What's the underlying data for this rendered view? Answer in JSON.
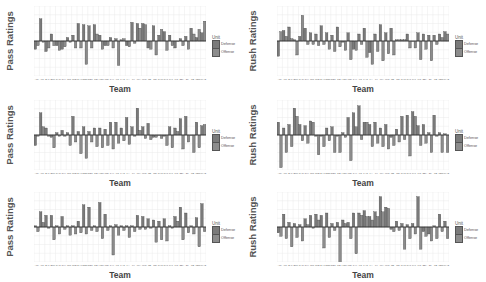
{
  "chart_data": [
    {
      "type": "bar",
      "title": "",
      "xlabel": "Team",
      "ylabel": "Pass Ratings",
      "legend": {
        "title": "Unit",
        "entries": [
          "Defense",
          "Offense"
        ],
        "position": "right"
      },
      "grid": true,
      "ylim": [
        -1,
        1
      ],
      "categories": [
        "ARI",
        "ATL",
        "BAL",
        "BUF",
        "CAR",
        "CHI",
        "CIN",
        "CLE",
        "DAL",
        "DEN",
        "DET",
        "GB",
        "HOU",
        "IND",
        "JAX",
        "KC",
        "LAC",
        "LA",
        "LV",
        "MIA",
        "MIN",
        "NE",
        "NO",
        "NYG",
        "NYJ",
        "PHI",
        "PIT",
        "SEA",
        "SF",
        "TB",
        "TEN",
        "WAS"
      ],
      "series": [
        {
          "name": "Defense",
          "values": [
            -0.35,
            0.95,
            -0.45,
            0.3,
            -0.2,
            -0.35,
            0.15,
            0.25,
            0.75,
            0.7,
            0.65,
            0.7,
            0.25,
            -0.2,
            0.15,
            0.1,
            0.05,
            -0.2,
            0.8,
            0.75,
            0.75,
            -0.3,
            0.65,
            0.25,
            0.4,
            0.25,
            -0.3,
            0.1,
            0.2,
            0.55,
            0.15,
            0.35
          ]
        },
        {
          "name": "Offense",
          "values": [
            -0.2,
            -0.05,
            -0.3,
            -0.2,
            -0.4,
            -0.25,
            -0.05,
            -0.3,
            -0.3,
            -1.0,
            -0.3,
            0.3,
            -0.35,
            -0.2,
            -0.3,
            -1.05,
            0.1,
            -0.25,
            -0.1,
            0.55,
            0.7,
            -0.35,
            -0.6,
            0.5,
            -0.4,
            -0.2,
            0.0,
            -0.2,
            -0.35,
            0.3,
            0.5,
            0.85
          ]
        }
      ]
    },
    {
      "type": "bar",
      "title": "",
      "xlabel": "Team",
      "ylabel": "Rush Ratings",
      "legend": {
        "title": "Unit",
        "entries": [
          "Defense",
          "Offense"
        ],
        "position": "right"
      },
      "grid": true,
      "ylim": [
        -1,
        1
      ],
      "categories": [
        "ARI",
        "ATL",
        "BAL",
        "BUF",
        "CAR",
        "CHI",
        "CIN",
        "CLE",
        "DAL",
        "DEN",
        "DET",
        "GB",
        "HOU",
        "IND",
        "JAX",
        "KC",
        "LAC",
        "LA",
        "LV",
        "MIA",
        "MIN",
        "NE",
        "NO",
        "NYG",
        "NYJ",
        "PHI",
        "PIT",
        "SEA",
        "SF",
        "TB",
        "TEN",
        "WAS"
      ],
      "series": [
        {
          "name": "Defense",
          "values": [
            -0.65,
            0.45,
            0.6,
            0.05,
            0.2,
            0.55,
            0.35,
            0.3,
            0.65,
            0.35,
            0.25,
            0.6,
            -0.05,
            0.35,
            -0.35,
            0.3,
            0.55,
            -0.5,
            0.3,
            0.7,
            0.35,
            0.55,
            0.05,
            0.05,
            0.3,
            0.0,
            0.35,
            0.3,
            0.25,
            0.25,
            0.3,
            0.4
          ]
        },
        {
          "name": "Offense",
          "values": [
            0.4,
            0.2,
            0.1,
            -0.6,
            1.1,
            -0.15,
            -0.15,
            -0.2,
            -0.15,
            -0.35,
            -0.45,
            -0.25,
            -0.4,
            -0.8,
            -0.4,
            -0.15,
            -0.7,
            -1.0,
            -0.45,
            -0.85,
            -0.55,
            -0.6,
            0.05,
            0.05,
            -0.3,
            -0.3,
            -0.8,
            -0.35,
            -0.85,
            -0.15,
            0.15,
            0.3
          ]
        }
      ]
    },
    {
      "type": "bar",
      "title": "",
      "xlabel": "Team",
      "ylabel": "Pass Ratings",
      "legend": {
        "title": "Unit",
        "entries": [
          "Defense",
          "Offense"
        ],
        "position": "right"
      },
      "grid": true,
      "ylim": [
        -1,
        1
      ],
      "categories": [
        "ARI",
        "ATL",
        "BAL",
        "BUF",
        "CAR",
        "CHI",
        "CIN",
        "CLE",
        "DAL",
        "DEN",
        "DET",
        "GB",
        "HOU",
        "IND",
        "JAX",
        "KC",
        "LAC",
        "LA",
        "LV",
        "MIA",
        "MIN",
        "NE",
        "NO",
        "NYG",
        "NYJ",
        "PHI",
        "PIT",
        "SEA",
        "SF",
        "TB",
        "TEN",
        "WAS"
      ],
      "series": [
        {
          "name": "Defense",
          "values": [
            -0.45,
            0.95,
            0.3,
            -0.1,
            0.1,
            0.2,
            0.1,
            0.8,
            0.15,
            0.35,
            0.15,
            0.3,
            0.3,
            0.25,
            0.55,
            0.55,
            0.3,
            0.75,
            0.35,
            1.15,
            0.35,
            0.5,
            -0.1,
            0.0,
            -0.05,
            0.35,
            0.3,
            0.7,
            0.8,
            0.0,
            0.55,
            0.4
          ]
        },
        {
          "name": "Offense",
          "values": [
            -0.05,
            0.35,
            -0.05,
            -0.55,
            -0.05,
            -0.05,
            -0.45,
            -0.3,
            -0.8,
            -1.0,
            -0.3,
            -0.5,
            -0.55,
            -0.45,
            -0.6,
            -0.35,
            -0.25,
            -0.4,
            -0.05,
            0.2,
            -0.15,
            -0.2,
            -0.1,
            -0.15,
            -0.45,
            -0.55,
            0.15,
            -0.6,
            -0.3,
            -0.75,
            -0.55,
            0.45
          ]
        }
      ]
    },
    {
      "type": "bar",
      "title": "",
      "xlabel": "Team",
      "ylabel": "Rush Ratings",
      "legend": {
        "title": "Unit",
        "entries": [
          "Defense",
          "Offense"
        ],
        "position": "right"
      },
      "grid": true,
      "ylim": [
        -1,
        1
      ],
      "categories": [
        "ARI",
        "ATL",
        "BAL",
        "BUF",
        "CAR",
        "CHI",
        "CIN",
        "CLE",
        "DAL",
        "DEN",
        "DET",
        "GB",
        "HOU",
        "IND",
        "JAX",
        "KC",
        "LAC",
        "LA",
        "LV",
        "MIA",
        "MIN",
        "NE",
        "NO",
        "NYG",
        "NYJ",
        "PHI",
        "PIT",
        "SEA",
        "SF",
        "TB",
        "TEN",
        "WAS"
      ],
      "series": [
        {
          "name": "Defense",
          "values": [
            0.55,
            0.3,
            0.45,
            1.15,
            0.45,
            0.4,
            0.6,
            -0.05,
            -0.05,
            0.3,
            0.35,
            -0.05,
            0.1,
            0.75,
            0.95,
            1.25,
            0.55,
            0.45,
            0.55,
            0.3,
            0.45,
            -0.1,
            0.25,
            0.8,
            0.85,
            1.0,
            0.4,
            0.45,
            0.1,
            0.85,
            0.1,
            0.05
          ]
        },
        {
          "name": "Offense",
          "values": [
            -1.4,
            -0.75,
            -0.5,
            0.8,
            -0.25,
            -0.35,
            0.55,
            -0.85,
            -0.5,
            -0.25,
            -0.75,
            -0.75,
            -0.1,
            -1.1,
            0.35,
            -0.2,
            0.55,
            -0.5,
            -0.35,
            -0.5,
            -0.6,
            -0.45,
            -0.3,
            -0.2,
            -0.9,
            0.8,
            -0.45,
            -0.35,
            -0.75,
            -0.05,
            -0.75,
            -0.75
          ]
        }
      ]
    },
    {
      "type": "bar",
      "title": "",
      "xlabel": "Team",
      "ylabel": "Pass Ratings",
      "legend": {
        "title": "Unit",
        "entries": [
          "Defense",
          "Offense"
        ],
        "position": "right"
      },
      "grid": true,
      "ylim": [
        -1,
        1
      ],
      "categories": [
        "ARI",
        "ATL",
        "BAL",
        "BUF",
        "CAR",
        "CHI",
        "CIN",
        "CLE",
        "DAL",
        "DEN",
        "DET",
        "GB",
        "HOU",
        "IND",
        "JAX",
        "KC",
        "LAC",
        "LA",
        "LV",
        "MIA",
        "MIN",
        "NE",
        "NO",
        "NYG",
        "NYJ",
        "PHI",
        "PIT",
        "SEA",
        "SF",
        "TB",
        "TEN",
        "WAS"
      ],
      "series": [
        {
          "name": "Defense",
          "values": [
            0.05,
            0.65,
            0.5,
            0.5,
            0.05,
            0.45,
            0.05,
            0.05,
            0.25,
            0.95,
            0.85,
            0.05,
            1.05,
            0.55,
            0.05,
            0.1,
            0.05,
            0.05,
            0.05,
            0.5,
            0.45,
            0.35,
            0.3,
            0.25,
            0.35,
            0.05,
            0.45,
            0.85,
            0.6,
            0.05,
            0.4,
            1.0
          ]
        },
        {
          "name": "Offense",
          "values": [
            -0.2,
            0.2,
            -0.05,
            -0.55,
            -0.3,
            -0.1,
            -0.35,
            -0.3,
            -0.25,
            -0.3,
            -0.15,
            -0.2,
            -0.5,
            -0.15,
            -1.2,
            -0.35,
            -0.15,
            -0.45,
            -0.2,
            -0.1,
            -0.1,
            -0.05,
            -0.65,
            -0.55,
            -0.6,
            -0.05,
            0.25,
            -0.55,
            -0.25,
            -0.3,
            -0.85,
            -0.2
          ]
        }
      ]
    },
    {
      "type": "bar",
      "title": "",
      "xlabel": "Team",
      "ylabel": "Rush Ratings",
      "legend": {
        "title": "Unit",
        "entries": [
          "Defense",
          "Offense"
        ],
        "position": "right"
      },
      "grid": true,
      "ylim": [
        -1,
        1
      ],
      "categories": [
        "ARI",
        "ATL",
        "BAL",
        "BUF",
        "CAR",
        "CHI",
        "CIN",
        "CLE",
        "DAL",
        "DEN",
        "DET",
        "GB",
        "HOU",
        "IND",
        "JAX",
        "KC",
        "LAC",
        "LA",
        "LV",
        "MIA",
        "MIN",
        "NE",
        "NO",
        "NYG",
        "NYJ",
        "PHI",
        "PIT",
        "SEA",
        "SF",
        "TB",
        "TEN",
        "WAS"
      ],
      "series": [
        {
          "name": "Defense",
          "values": [
            -0.25,
            0.55,
            0.2,
            0.15,
            0.1,
            0.35,
            0.5,
            0.55,
            0.5,
            0.6,
            0.15,
            0.2,
            0.3,
            0.2,
            0.6,
            0.6,
            0.7,
            0.45,
            0.65,
            1.3,
            0.85,
            -0.1,
            0.25,
            0.15,
            0.1,
            0.15,
            1.3,
            -0.2,
            -0.3,
            0.05,
            0.55,
            0.25
          ]
        },
        {
          "name": "Offense",
          "values": [
            -0.4,
            -0.5,
            -0.85,
            -0.45,
            -0.6,
            0.1,
            -0.05,
            0.3,
            -0.9,
            -0.45,
            -0.15,
            -1.8,
            0.15,
            -0.5,
            -1.15,
            0.5,
            0.45,
            0.3,
            0.45,
            0.65,
            0.8,
            -0.2,
            -0.15,
            -0.95,
            -0.5,
            -0.3,
            -0.95,
            -0.4,
            -0.6,
            -0.5,
            -0.2,
            -0.5
          ]
        }
      ]
    }
  ],
  "panels": [
    {
      "ylabel": "Pass Ratings",
      "xlabel": "Team",
      "legend_title": "Unit",
      "legend_defense": "Defense",
      "legend_offense": "Offense"
    },
    {
      "ylabel": "Rush Ratings",
      "xlabel": "Team",
      "legend_title": "Unit",
      "legend_defense": "Defense",
      "legend_offense": "Offense"
    },
    {
      "ylabel": "Pass Ratings",
      "xlabel": "Team",
      "legend_title": "Unit",
      "legend_defense": "Defense",
      "legend_offense": "Offense"
    },
    {
      "ylabel": "Rush Ratings",
      "xlabel": "Team",
      "legend_title": "Unit",
      "legend_defense": "Defense",
      "legend_offense": "Offense"
    },
    {
      "ylabel": "Pass Ratings",
      "xlabel": "Team",
      "legend_title": "Unit",
      "legend_defense": "Defense",
      "legend_offense": "Offense"
    },
    {
      "ylabel": "Rush Ratings",
      "xlabel": "Team",
      "legend_title": "Unit",
      "legend_defense": "Defense",
      "legend_offense": "Offense"
    }
  ],
  "colors": {
    "defense": "#7a7a7a",
    "offense": "#8c8c8c",
    "bar_outline": "#3a3a3a",
    "grid": "#ebebeb",
    "zero_line": "#333333"
  }
}
